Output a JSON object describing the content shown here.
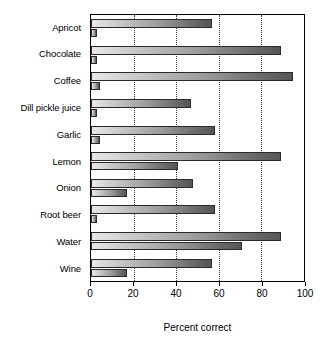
{
  "chart_data": {
    "type": "bar",
    "orientation": "horizontal",
    "title": "",
    "xlabel": "Percent correct",
    "ylabel": "",
    "xlim": [
      0,
      100
    ],
    "xticks": [
      0,
      20,
      40,
      60,
      80,
      100
    ],
    "xtick_labels": [
      "0",
      "20",
      "40",
      "60",
      "80",
      "100"
    ],
    "grid": "vertical-dotted",
    "legend": "none",
    "categories": [
      "Apricot",
      "Chocolate",
      "Coffee",
      "Dill pickle juice",
      "Garlic",
      "Lemon",
      "Onion",
      "Root beer",
      "Water",
      "Wine"
    ],
    "series": [
      {
        "name": "upper",
        "values": [
          57,
          89,
          95,
          47,
          58,
          89,
          48,
          58,
          89,
          57
        ]
      },
      {
        "name": "lower",
        "values": [
          3,
          3,
          4,
          3,
          4,
          41,
          17,
          3,
          71,
          17
        ]
      }
    ]
  },
  "axis": {
    "title": "Percent correct"
  },
  "style": {
    "bar_light": "#e8e8e8",
    "bar_dark": "#555555",
    "bar_border": "#2a2a2a",
    "frame": "#000000",
    "grid": "#3a3a3a",
    "background": "#ffffff"
  }
}
